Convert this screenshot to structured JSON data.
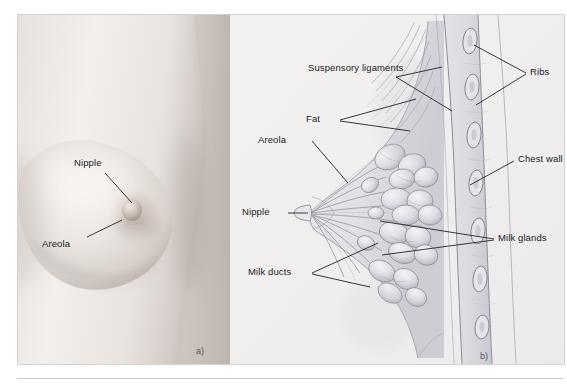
{
  "figure": {
    "panel_a": {
      "tag": "a)",
      "labels": [
        {
          "name": "nipple",
          "text": "Nipple"
        },
        {
          "name": "areola",
          "text": "Areola"
        }
      ]
    },
    "panel_b": {
      "tag": "b)",
      "labels": [
        {
          "name": "suspensory-ligaments",
          "text": "Suspensory ligaments"
        },
        {
          "name": "fat",
          "text": "Fat"
        },
        {
          "name": "areola",
          "text": "Areola"
        },
        {
          "name": "nipple",
          "text": "Nipple"
        },
        {
          "name": "milk-ducts",
          "text": "Milk ducts"
        },
        {
          "name": "ribs",
          "text": "Ribs"
        },
        {
          "name": "chest-wall",
          "text": "Chest wall"
        },
        {
          "name": "milk-glands",
          "text": "Milk glands"
        }
      ]
    },
    "colors": {
      "plate_background": "#f1f1f1",
      "label_text": "#1d1d1d",
      "leader_line": "#2a2a2a",
      "skin_light": "#efecea",
      "skin_mid": "#d9d2cd",
      "skin_shadow": "#b3aaa4",
      "tissue_line": "#8d8f96",
      "frame_border": "#d2d2d2"
    }
  }
}
